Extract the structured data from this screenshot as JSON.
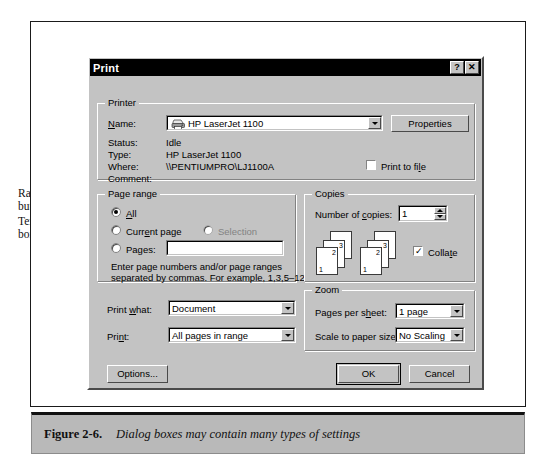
{
  "figure": {
    "number": "Figure 2-6.",
    "caption": "Dialog boxes may contain many types of settings"
  },
  "annotations": {
    "pulldown": "Pull-down menu",
    "whats_this": "What's This? button",
    "radio_line1": "Radio",
    "radio_line2": "buttons",
    "textbox_line1": "Text",
    "textbox_line2": "box",
    "check_line1": "Check",
    "check_line2": "box",
    "buttons": "Buttons"
  },
  "dialog": {
    "title": "Print",
    "titlebar_help": "?",
    "titlebar_close": "✕",
    "printer": {
      "group_title": "Printer",
      "name_label": "Name:",
      "name_value": "HP LaserJet 1100",
      "properties_button": "Properties",
      "status_label": "Status:",
      "status_value": "Idle",
      "type_label": "Type:",
      "type_value": "HP LaserJet 1100",
      "where_label": "Where:",
      "where_value": "\\\\PENTIUMPRO\\LJ1100A",
      "comment_label": "Comment:",
      "comment_value": "",
      "print_to_file_label": "Print to file",
      "print_to_file_checked": false
    },
    "page_range": {
      "group_title": "Page range",
      "all_label": "All",
      "all_selected": true,
      "current_page_label": "Current page",
      "current_page_selected": false,
      "selection_label": "Selection",
      "selection_selected": false,
      "selection_disabled": true,
      "pages_label": "Pages:",
      "pages_selected": false,
      "pages_value": "",
      "hint_line1": "Enter page numbers and/or page ranges",
      "hint_line2": "separated by commas.  For example, 1,3,5–12"
    },
    "copies": {
      "group_title": "Copies",
      "number_label": "Number of copies:",
      "number_value": "1",
      "collate_label": "Collate",
      "collate_checked": true
    },
    "print_what": {
      "label": "Print what:",
      "value": "Document"
    },
    "print_range": {
      "label": "Print:",
      "value": "All pages in range"
    },
    "zoom": {
      "group_title": "Zoom",
      "pages_per_sheet_label": "Pages per sheet:",
      "pages_per_sheet_value": "1 page",
      "scale_label": "Scale to paper size:",
      "scale_value": "No Scaling"
    },
    "footer": {
      "options_button": "Options...",
      "ok_button": "OK",
      "cancel_button": "Cancel"
    }
  },
  "colors": {
    "dialog_face": "#c3c3c3",
    "titlebar": "#000000",
    "field_bg": "#ffffff",
    "disabled_text": "#828282",
    "caption_bar": "#b9b9b9"
  }
}
